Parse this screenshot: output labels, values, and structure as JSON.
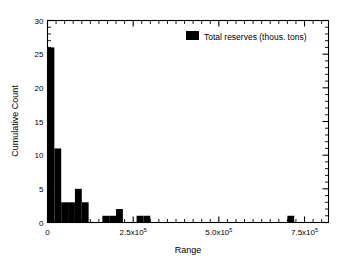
{
  "chart_data": {
    "type": "bar",
    "title": "",
    "subtitle": "",
    "xlabel": "Range",
    "ylabel": "Cumulative Count",
    "xlim": [
      0,
      820000
    ],
    "ylim": [
      0,
      30
    ],
    "grid": false,
    "legend_position": "top-right",
    "legend": [
      {
        "label": "Total reserves (thous. tons)",
        "color": "#000000"
      }
    ],
    "x_tick_labels": [
      "0",
      "2.5x10",
      "5.0x10",
      "7.5x10"
    ],
    "x_tick_exponent": "5",
    "x_tick_values": [
      0,
      250000,
      500000,
      750000
    ],
    "y_tick_labels": [
      "0",
      "5",
      "10",
      "15",
      "20",
      "25",
      "30"
    ],
    "y_tick_values": [
      0,
      5,
      10,
      15,
      20,
      25,
      30
    ],
    "y_minor_step": 1,
    "x_minor_step": 25000,
    "bin_width": 20000,
    "series": [
      {
        "name": "Total reserves (thous. tons)",
        "color": "#000000",
        "bins": [
          {
            "x0": 0,
            "x1": 20000,
            "value": 26
          },
          {
            "x0": 20000,
            "x1": 40000,
            "value": 11
          },
          {
            "x0": 40000,
            "x1": 60000,
            "value": 3
          },
          {
            "x0": 60000,
            "x1": 80000,
            "value": 3
          },
          {
            "x0": 80000,
            "x1": 100000,
            "value": 5
          },
          {
            "x0": 100000,
            "x1": 120000,
            "value": 3
          },
          {
            "x0": 120000,
            "x1": 140000,
            "value": 0
          },
          {
            "x0": 140000,
            "x1": 160000,
            "value": 0
          },
          {
            "x0": 160000,
            "x1": 180000,
            "value": 1
          },
          {
            "x0": 180000,
            "x1": 200000,
            "value": 1
          },
          {
            "x0": 200000,
            "x1": 220000,
            "value": 2
          },
          {
            "x0": 220000,
            "x1": 240000,
            "value": 0
          },
          {
            "x0": 240000,
            "x1": 260000,
            "value": 0
          },
          {
            "x0": 260000,
            "x1": 280000,
            "value": 1
          },
          {
            "x0": 280000,
            "x1": 300000,
            "value": 1
          },
          {
            "x0": 700000,
            "x1": 720000,
            "value": 1
          }
        ]
      }
    ]
  }
}
